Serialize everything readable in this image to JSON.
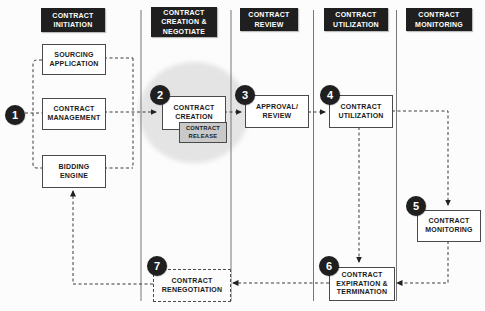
{
  "columns": [
    {
      "id": "initiation",
      "label": "CONTRACT\nINITIATION"
    },
    {
      "id": "creation",
      "label": "CONTRACT\nCREATION &\nNEGOTIATE"
    },
    {
      "id": "review",
      "label": "CONTRACT\nREVIEW"
    },
    {
      "id": "utilization",
      "label": "CONTRACT\nUTILIZATION"
    },
    {
      "id": "monitoring",
      "label": "CONTRACT\nMONITORING"
    }
  ],
  "steps": [
    "1",
    "2",
    "3",
    "4",
    "5",
    "6",
    "7"
  ],
  "nodes": {
    "sourcing_application": {
      "label": "SOURCING\nAPPLICATION"
    },
    "contract_management": {
      "label": "CONTRACT\nMANAGEMENT"
    },
    "bidding_engine": {
      "label": "BIDDING\nENGINE"
    },
    "contract_creation": {
      "label": "CONTRACT\nCREATION",
      "step": "2"
    },
    "contract_release": {
      "label": "CONTRACT\nRELEASE"
    },
    "approval_review": {
      "label": "APPROVAL/\nREVIEW",
      "step": "3"
    },
    "contract_utilization": {
      "label": "CONTRACT\nUTILIZATION",
      "step": "4"
    },
    "contract_monitoring": {
      "label": "CONTRACT\nMONITORING",
      "step": "5"
    },
    "contract_expiration": {
      "label": "CONTRACT\nEXPIRATION &\nTERMINATION",
      "step": "6"
    },
    "contract_renegotiation": {
      "label": "CONTRACT\nRENEGOTIATION",
      "step": "7"
    }
  },
  "colors": {
    "header_bg": "#1f1f1f",
    "badge_bg": "#1f1f1f",
    "box_border": "#4a4a4a",
    "line": "#3a3a3a",
    "highlight_ellipse": "#e4e4e4",
    "release_bg": "#c9c9c9",
    "divider": "#777777"
  }
}
